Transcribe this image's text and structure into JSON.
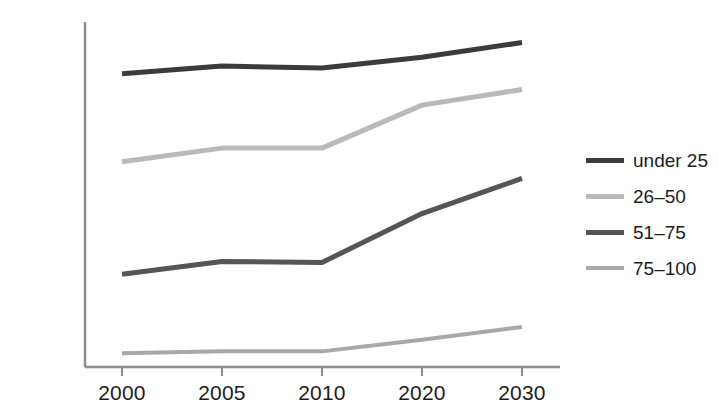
{
  "chart_data": {
    "type": "line",
    "title": "",
    "subtitle": "",
    "xlabel": "",
    "ylabel": "",
    "x": [
      2000,
      2005,
      2010,
      2020,
      2030
    ],
    "categories": [
      "2000",
      "2005",
      "2010",
      "2020",
      "2030"
    ],
    "xtick_labels": [
      "2000",
      "2005",
      "2010",
      "2020",
      "2030"
    ],
    "ytick_labels": [
      "0",
      "500 M",
      "1 B",
      "1.5 B",
      "2 B",
      "2.5 B",
      "3 B",
      "3.5 B"
    ],
    "ytick_values": [
      0,
      500000000,
      1000000000,
      1500000000,
      2000000000,
      2500000000,
      3000000000,
      3500000000
    ],
    "ylim": [
      0,
      3500000000
    ],
    "grid": false,
    "legend_position": "right",
    "series": [
      {
        "name": "under 25",
        "color": "#3b3b3b",
        "width": 5,
        "values": [
          3.0,
          3.08,
          3.06,
          3.17,
          3.32
        ]
      },
      {
        "name": "26–50",
        "color": "#b9b9b9",
        "width": 5,
        "values": [
          2.1,
          2.24,
          2.24,
          2.68,
          2.84
        ]
      },
      {
        "name": "51–75",
        "color": "#555555",
        "width": 5,
        "values": [
          0.95,
          1.08,
          1.07,
          1.57,
          1.93
        ]
      },
      {
        "name": "75–100",
        "color": "#a8a8a8",
        "width": 4,
        "values": [
          0.14,
          0.16,
          0.16,
          0.28,
          0.41
        ]
      }
    ],
    "units": "billions",
    "axis_color": "#8d8d8d"
  },
  "legend": {
    "items": [
      {
        "label": "under 25"
      },
      {
        "label": "26–50"
      },
      {
        "label": "51–75"
      },
      {
        "label": "75–100"
      }
    ]
  }
}
